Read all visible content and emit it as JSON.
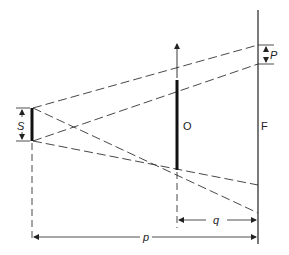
{
  "diagram": {
    "type": "geometric-unsharpness",
    "labels": {
      "source": "S",
      "object": "O",
      "film": "F",
      "penumbra": "P",
      "source_film_distance": "p",
      "object_film_distance": "q"
    },
    "colors": {
      "line": "#222222",
      "background": "#ffffff"
    }
  }
}
